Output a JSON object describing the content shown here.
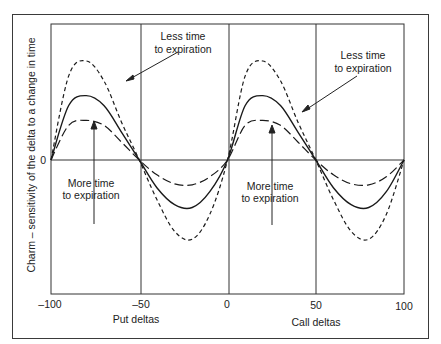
{
  "chart_data": {
    "type": "line",
    "title": "",
    "xlabel_left": "Put deltas",
    "xlabel_right": "Call deltas",
    "ylabel": "Charm – sensitivity of the delta to a change in time",
    "xlim": [
      -100,
      100
    ],
    "x_ticks": [
      "-100",
      "-50",
      "0",
      "50",
      "100"
    ],
    "y_ticks": [
      "0"
    ],
    "grid": {
      "vertical_lines_at": [
        -50,
        0,
        50
      ],
      "horizontal_line_at": 0
    },
    "x": [
      -100,
      -90,
      -80,
      -70,
      -60,
      -50,
      -40,
      -30,
      -20,
      -10,
      0,
      10,
      20,
      30,
      40,
      50,
      60,
      70,
      80,
      90,
      100
    ],
    "series": [
      {
        "name": "Less time to expiration",
        "style": "short-dash",
        "values": [
          0,
          0.85,
          1.0,
          0.8,
          0.38,
          0,
          -0.4,
          -0.72,
          -0.8,
          -0.55,
          0,
          0.85,
          1.0,
          0.8,
          0.38,
          0,
          -0.4,
          -0.72,
          -0.8,
          -0.55,
          0
        ]
      },
      {
        "name": "Intermediate",
        "style": "solid",
        "values": [
          0,
          0.55,
          0.65,
          0.55,
          0.28,
          0,
          -0.28,
          -0.45,
          -0.48,
          -0.32,
          0,
          0.55,
          0.65,
          0.55,
          0.28,
          0,
          -0.28,
          -0.45,
          -0.48,
          -0.32,
          0
        ]
      },
      {
        "name": "More time to expiration",
        "style": "long-dash",
        "values": [
          0,
          0.35,
          0.4,
          0.35,
          0.18,
          0,
          -0.15,
          -0.24,
          -0.25,
          -0.17,
          0,
          0.35,
          0.4,
          0.35,
          0.18,
          0,
          -0.15,
          -0.24,
          -0.25,
          -0.17,
          0
        ]
      }
    ],
    "annotations": [
      {
        "text": [
          "Less time",
          "to expiration"
        ],
        "position": "left",
        "points_to": "short-dash"
      },
      {
        "text": [
          "More time",
          "to expiration"
        ],
        "position": "left",
        "points_to": "long-dash"
      },
      {
        "text": [
          "Less time",
          "to expiration"
        ],
        "position": "right",
        "points_to": "short-dash"
      },
      {
        "text": [
          "More time",
          "to expiration"
        ],
        "position": "right",
        "points_to": "long-dash"
      }
    ],
    "ylim": [
      -1.35,
      1.35
    ]
  },
  "labels": {
    "ylabel": "Charm – sensitivity of the delta to a change in time",
    "y_zero": "0",
    "ticks": [
      "–100",
      "–50",
      "0",
      "50",
      "100"
    ],
    "put_deltas": "Put deltas",
    "call_deltas": "Call deltas",
    "less_1": "Less time",
    "less_2": "to expiration",
    "more_1": "More time",
    "more_2": "to expiration"
  }
}
